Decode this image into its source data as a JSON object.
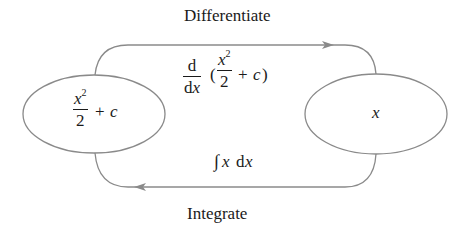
{
  "diagram": {
    "title_top": "Differentiate",
    "title_bottom": "Integrate",
    "left_node": {
      "numerator_var": "x",
      "numerator_exp": "2",
      "denominator": "2",
      "suffix_op": "+",
      "suffix_var": "c"
    },
    "right_node": {
      "label": "x"
    },
    "top_edge": {
      "label": "d/dx (x²/2 + c)",
      "d_num": "d",
      "d_den_d": "d",
      "d_den_x": "x",
      "paren_open": "(",
      "inner_num_var": "x",
      "inner_num_exp": "2",
      "inner_den": "2",
      "inner_op": "+",
      "inner_var": "c",
      "paren_close": ")",
      "direction": "left-to-right"
    },
    "bottom_edge": {
      "label": "∫x dx",
      "integral_sign": "∫",
      "var": "x",
      "d": "d",
      "dvar": "x",
      "direction": "right-to-left"
    },
    "colors": {
      "stroke": "#8a8a8a",
      "text": "#1a1a1a",
      "background": "#ffffff"
    }
  }
}
